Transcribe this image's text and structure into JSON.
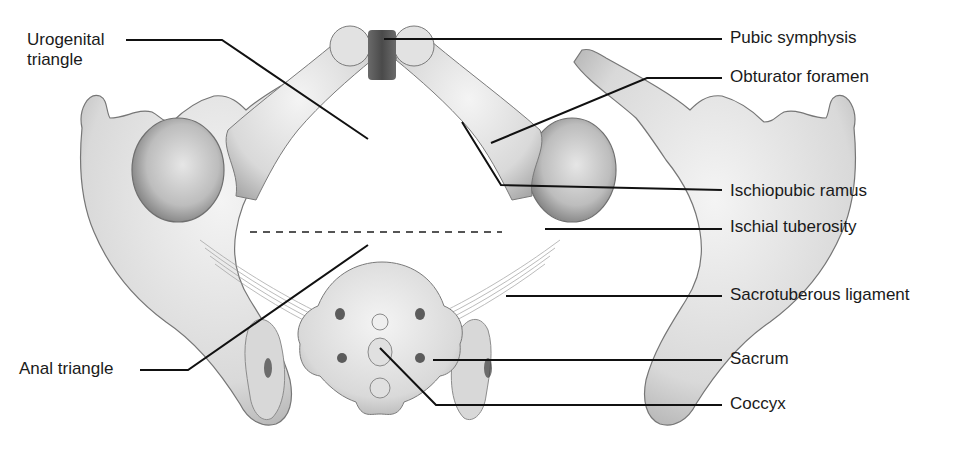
{
  "figure": {
    "colors": {
      "bone_fill": "#e4e4e4",
      "bone_shadow": "#9a9a9a",
      "bone_outline": "#6f6f6f",
      "symphysis": "#5a5a5a",
      "leader_line": "#111111",
      "background": "#ffffff"
    }
  },
  "labels": {
    "left": [
      {
        "id": "urogenital-triangle",
        "text": "Urogenital\ntriangle",
        "x": 27,
        "y": 30
      },
      {
        "id": "anal-triangle",
        "text": "Anal triangle",
        "x": 19,
        "y": 359
      }
    ],
    "right": [
      {
        "id": "pubic-symphysis",
        "text": "Pubic symphysis",
        "x": 730,
        "y": 28
      },
      {
        "id": "obturator-foramen",
        "text": "Obturator foramen",
        "x": 730,
        "y": 67
      },
      {
        "id": "ischiopubic-ramus",
        "text": "Ischiopubic ramus",
        "x": 730,
        "y": 181
      },
      {
        "id": "ischial-tuberosity",
        "text": "Ischial tuberosity",
        "x": 730,
        "y": 217
      },
      {
        "id": "sacrotuberous-ligament",
        "text": "Sacrotuberous ligament",
        "x": 730,
        "y": 285
      },
      {
        "id": "sacrum",
        "text": "Sacrum",
        "x": 730,
        "y": 349
      },
      {
        "id": "coccyx",
        "text": "Coccyx",
        "x": 730,
        "y": 394
      }
    ]
  },
  "leader_lines": [
    {
      "label": "urogenital-triangle",
      "points": "126,40 222,40 368,139"
    },
    {
      "label": "pubic-symphysis",
      "points": "384,39 722,39"
    },
    {
      "label": "obturator-foramen",
      "points": "491,143 647,78 722,78"
    },
    {
      "label": "ischiopubic-ramus",
      "points": "462,122 501,185 722,190"
    },
    {
      "label": "ischial-tuberosity",
      "points": "545,229 722,229"
    },
    {
      "label": "sacrotuberous-ligament",
      "points": "506,296 722,296"
    },
    {
      "label": "sacrum",
      "points": "433,360 722,360"
    },
    {
      "label": "coccyx",
      "points": "380,348 436,405 722,405"
    },
    {
      "label": "anal-triangle",
      "points": "140,370 188,370 368,245"
    }
  ],
  "divider": {
    "description": "Dashed line separating urogenital and anal triangles",
    "x1": 250,
    "y1": 232,
    "x2": 502,
    "y2": 232
  }
}
